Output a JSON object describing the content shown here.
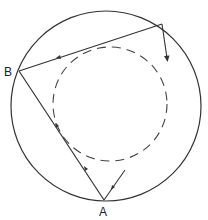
{
  "diagram": {
    "outer_circle": {
      "cx": 106,
      "cy": 106,
      "r": 95
    },
    "inner_dashed_circle": {
      "cx": 110,
      "cy": 104,
      "r": 57
    },
    "points": {
      "A": {
        "label": "A",
        "x": 104,
        "y": 200
      },
      "B": {
        "label": "B",
        "x": 19,
        "y": 71
      },
      "C": {
        "label": "",
        "x": 162,
        "y": 24
      }
    },
    "labels": {
      "A": "A",
      "B": "B"
    },
    "colors": {
      "stroke": "#333333",
      "background": "#ffffff"
    }
  }
}
